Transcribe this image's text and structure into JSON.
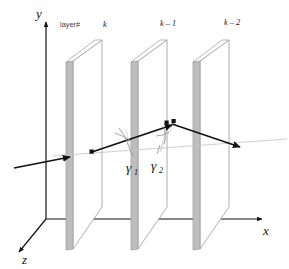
{
  "figure": {
    "kind": "3d-ray-through-layers-diagram",
    "background_color": "#ffffff",
    "width": 289,
    "height": 269
  },
  "axes": {
    "y_label": "y",
    "x_label": "x",
    "z_label": "z",
    "color": "#111111"
  },
  "layers": {
    "caption": "layer#",
    "items": [
      {
        "index_label": "k"
      },
      {
        "index_label": "k – 1"
      },
      {
        "index_label": "k – 2"
      }
    ],
    "edge_color": "#b0b0b0",
    "face_color": "#ffffff",
    "outline_color": "#9a9a9a"
  },
  "angles": {
    "gamma1": {
      "symbol": "γ",
      "subscript": "1"
    },
    "gamma2": {
      "symbol": "γ",
      "subscript": "2"
    }
  },
  "ray": {
    "color": "#111111",
    "reference_line_color": "#c8c8c8"
  }
}
